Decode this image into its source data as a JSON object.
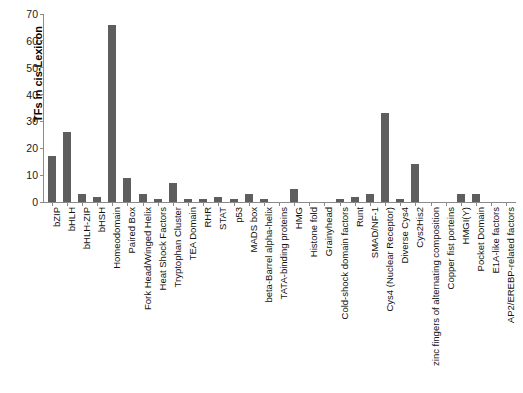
{
  "chart_data": {
    "type": "bar",
    "title": "",
    "xlabel": "",
    "ylabel": "TFs in cis-Lexicon",
    "ylim": [
      0,
      70
    ],
    "yticks": [
      0,
      10,
      20,
      30,
      40,
      50,
      60,
      70
    ],
    "grid": false,
    "legend": null,
    "bar_color": "#5e5e5e",
    "categories": [
      "bZIP",
      "bHLH",
      "bHLH-ZIP",
      "bHSH",
      "Homeodomain",
      "Paired Box",
      "Fork Head/Winged Helix",
      "Heat Shock Factors",
      "Tryptophan Cluster",
      "TEA Domain",
      "RHR",
      "STAT",
      "p53",
      "MADS box",
      "beta-Barrel alpha-helix",
      "TATA-binding proteins",
      "HMG",
      "Histone fold",
      "Grainyhead",
      "Cold-shock domain factors",
      "Runt",
      "SMAD/NF-1",
      "Cys4 (Nuclear Receptor)",
      "Diverse Cys4",
      "Cys2His2",
      "zinc fingers of alternating composition",
      "Copper fist porteins",
      "HMGI(Y)",
      "Pocket Domain",
      "E1A-like factors",
      "AP2/EREBP-related factors"
    ],
    "values": [
      17,
      26,
      3,
      2,
      66,
      9,
      3,
      1,
      7,
      1,
      1,
      2,
      1,
      3,
      1,
      0,
      5,
      0,
      0,
      1,
      2,
      3,
      33,
      1,
      14,
      0,
      0,
      3,
      3,
      0,
      0
    ]
  },
  "axis": {
    "y_title": "TFs in cis-Lexicon"
  }
}
